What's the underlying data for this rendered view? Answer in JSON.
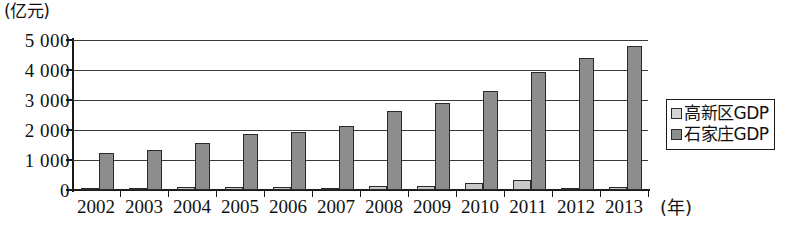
{
  "chart_data": {
    "type": "bar",
    "title": "",
    "subtitle": "",
    "xlabel": "(年)",
    "ylabel": "(亿元)",
    "categories": [
      "2002",
      "2003",
      "2004",
      "2005",
      "2006",
      "2007",
      "2008",
      "2009",
      "2010",
      "2011",
      "2012",
      "2013"
    ],
    "series": [
      {
        "name": "高新区GDP",
        "color": "#c9c9c9",
        "values": [
          60,
          70,
          110,
          110,
          110,
          70,
          120,
          150,
          250,
          340,
          80,
          90
        ]
      },
      {
        "name": "石家庄GDP",
        "color": "#8d8d8d",
        "values": [
          1220,
          1320,
          1580,
          1880,
          1920,
          2150,
          2650,
          2900,
          3300,
          3950,
          4400,
          4800
        ]
      }
    ],
    "ylim": [
      0,
      5000
    ],
    "y_ticks": [
      0,
      1000,
      2000,
      3000,
      4000,
      5000
    ],
    "y_tick_labels": [
      "0",
      "1 000",
      "2 000",
      "3 000",
      "4 000",
      "5 000"
    ],
    "grid": true,
    "legend_position": "right",
    "legend_entries": [
      {
        "label": "高新区GDP",
        "swatch": "light"
      },
      {
        "label": "石家庄GDP",
        "swatch": "dark"
      }
    ]
  },
  "axes": {
    "y_unit_caption": "(亿元)",
    "x_unit_caption": "(年)"
  }
}
